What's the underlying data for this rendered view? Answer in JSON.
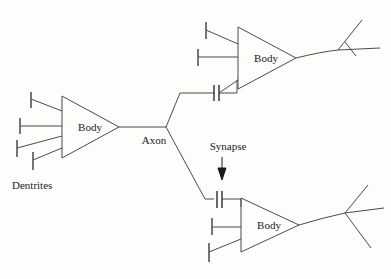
{
  "figure": {
    "background_color": "#fdfdfb",
    "line_color": "#4a4a52",
    "text_color": "#1a1a1a",
    "width": 391,
    "height": 279
  },
  "labels": {
    "dendrites": "Dentrites",
    "axon": "Axon",
    "synapse": "Synapse",
    "body_left": "Body",
    "body_upper_right": "Body",
    "body_lower_right": "Body"
  },
  "neurons": [
    {
      "id": "left-neuron",
      "body_label": "Body",
      "dendrite_count": 4,
      "synapse_on_dendrites": 0,
      "axon_label": "Axon",
      "axon_branches": 2
    },
    {
      "id": "upper-right-neuron",
      "body_label": "Body",
      "dendrite_count": 3,
      "synapse_on_dendrites": 1,
      "axon_label": "",
      "axon_branches": 3
    },
    {
      "id": "lower-right-neuron",
      "body_label": "Body",
      "dendrite_count": 3,
      "synapse_on_dendrites": 1,
      "axon_label": "",
      "axon_branches": 3
    }
  ],
  "annotations": [
    {
      "id": "synapse-annotation",
      "text": "Synapse",
      "marker": "down-arrow",
      "points_to": "synapse-symbol-lower"
    },
    {
      "id": "dendrites-annotation",
      "text": "Dentrites",
      "marker": "none",
      "points_to": "left-neuron-dendrites"
    }
  ]
}
